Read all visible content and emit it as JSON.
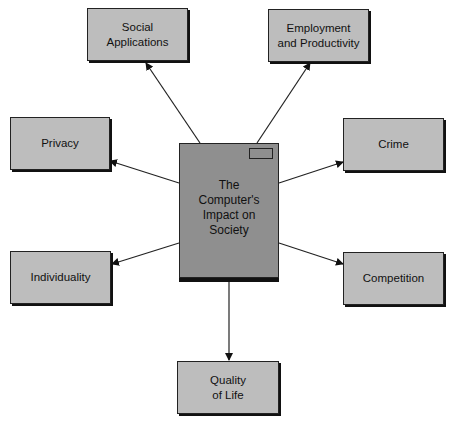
{
  "diagram": {
    "center": {
      "label": "The\nComputer's\nImpact on\nSociety"
    },
    "nodes": [
      {
        "id": "social-applications",
        "label": "Social\nApplications"
      },
      {
        "id": "employment-and-productivity",
        "label": "Employment\nand Productivity"
      },
      {
        "id": "privacy",
        "label": "Privacy"
      },
      {
        "id": "crime",
        "label": "Crime"
      },
      {
        "id": "individuality",
        "label": "Individuality"
      },
      {
        "id": "competition",
        "label": "Competition"
      },
      {
        "id": "quality-of-life",
        "label": "Quality\nof Life"
      }
    ],
    "colors": {
      "box_fill": "#bdbdbd",
      "center_fill": "#8f8f8f",
      "stroke": "#222222"
    }
  }
}
